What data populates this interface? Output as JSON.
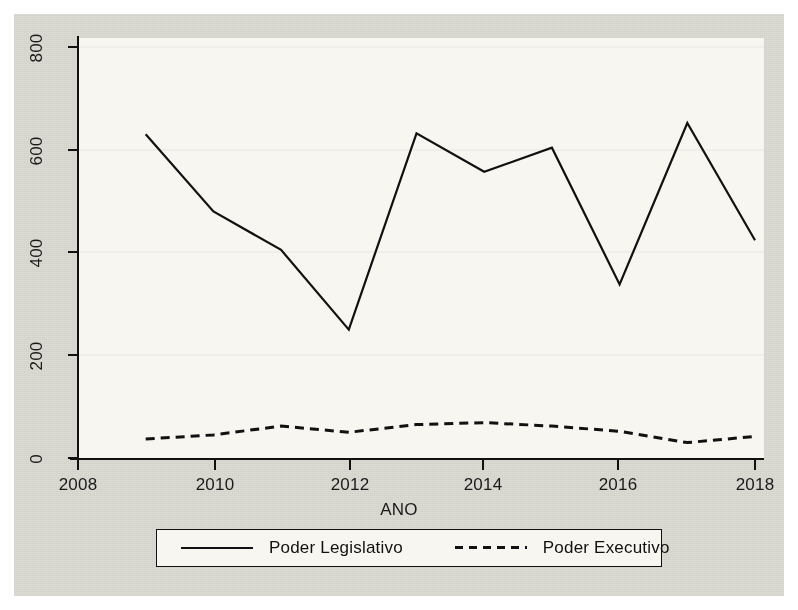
{
  "chart_data": {
    "type": "line",
    "title": "",
    "subtitle": "",
    "xlabel": "ANO",
    "ylabel": "",
    "x": [
      2009,
      2010,
      2011,
      2012,
      2013,
      2014,
      2015,
      2016,
      2017,
      2018
    ],
    "xlim": [
      2008,
      2018
    ],
    "ylim": [
      0,
      840
    ],
    "xticks": [
      2008,
      2010,
      2012,
      2014,
      2016,
      2018
    ],
    "xtick_labels": [
      "2008",
      "2010",
      "2012",
      "2014",
      "2016",
      "2018"
    ],
    "yticks": [
      0,
      200,
      400,
      600,
      800
    ],
    "ytick_labels": [
      "0",
      "200",
      "400",
      "600",
      "800"
    ],
    "grid": "horizontal-faint",
    "legend_position": "below",
    "series": [
      {
        "name": "Poder Legislativo",
        "style": "solid",
        "color": "#111111",
        "values": [
          630,
          480,
          405,
          250,
          632,
          557,
          604,
          338,
          652,
          424
        ]
      },
      {
        "name": "Poder Executivo",
        "style": "dashed",
        "color": "#111111",
        "values": [
          37,
          45,
          62,
          50,
          65,
          69,
          62,
          52,
          30,
          42
        ]
      }
    ]
  },
  "axes": {
    "x_title": "ANO",
    "y_title": ""
  },
  "legend": {
    "entries": [
      {
        "label": "Poder Legislativo",
        "key": "solid-line-key"
      },
      {
        "label": "Poder Executivo",
        "key": "dashed-line-key"
      }
    ]
  },
  "colors": {
    "graph_region_background": "#dcdcd4",
    "plot_region_background": "#f7f6f0",
    "axis": "#111111",
    "line": "#111111",
    "gridline": "#e8e6dd"
  }
}
